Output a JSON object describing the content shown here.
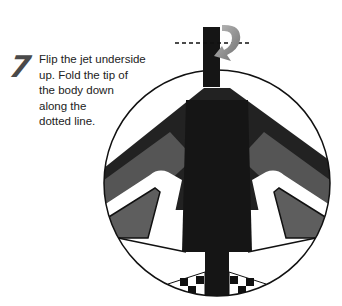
{
  "step": {
    "number": "7",
    "lines": [
      "Flip the jet underside",
      "up. Fold the tip of",
      "the body down",
      "along the",
      "dotted line."
    ]
  },
  "diagram": {
    "fold_line": "dotted",
    "fold_arrow": "curved-fold-down-arrow",
    "colors": {
      "body": "#151515",
      "wing_dark": "#2a2a2a",
      "panel_gray": "#5e5e5e",
      "light_panel": "#e8e8e8",
      "arrow": "#8a8a8a",
      "outline": "#111111"
    }
  }
}
